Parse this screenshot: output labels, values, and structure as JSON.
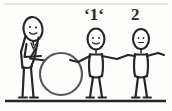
{
  "image": {
    "title": "Hand-drawn stick figures passing a ball",
    "background_color": "#fdfdfc",
    "ink_color": "#262626",
    "width": 172,
    "height": 111
  },
  "labels": {
    "figure_1": "ʻ1ʻ",
    "figure_2": "2"
  },
  "figures": [
    {
      "id": "figure-left",
      "label": "",
      "description": "person bending forward holding a large ball",
      "holds_ball": true
    },
    {
      "id": "figure-middle",
      "label": "ʻ1ʻ",
      "description": "stick figure with arms outstretched, left hand toward ball, right hand joined with figure 2",
      "holds_ball": false
    },
    {
      "id": "figure-right",
      "label": "2",
      "description": "stick figure with arms outstretched, left hand joined with figure 1",
      "holds_ball": false
    }
  ],
  "objects": {
    "ball": {
      "name": "ball",
      "shape": "circle",
      "filled": false
    },
    "ground": {
      "name": "ground-line",
      "shape": "horizontal-line"
    },
    "top_border": {
      "name": "top-border-line",
      "shape": "horizontal-line"
    }
  }
}
